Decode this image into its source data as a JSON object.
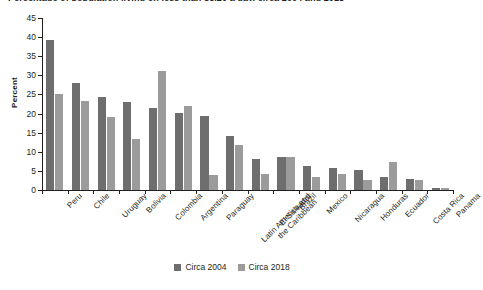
{
  "title_sliver": "Percentage of population living on less than $3.20 a day, circa 2004 and 2018",
  "chart_data": {
    "type": "bar",
    "title": "",
    "xlabel": "",
    "ylabel": "Percent",
    "ylim": [
      0,
      45
    ],
    "yticks": [
      0,
      5,
      10,
      15,
      20,
      25,
      30,
      35,
      40,
      45
    ],
    "grid": false,
    "legend_position": "bottom",
    "categories": [
      "Peru",
      "Chile",
      "Uruguay",
      "Bolivia",
      "Colombia",
      "Argentina",
      "Paraguay",
      "Latin America and\nthe Caribbean",
      "El Salvador",
      "Brazil",
      "Mexico",
      "Nicaragua",
      "Honduras",
      "Ecuador",
      "Costa Rica",
      "Panama"
    ],
    "series": [
      {
        "name": "Circa 2004",
        "color": "#6e6e6e",
        "values": [
          39.3,
          28.1,
          24.3,
          23.0,
          21.4,
          20.2,
          19.3,
          14.2,
          8.2,
          8.6,
          6.2,
          5.7,
          5.3,
          3.5,
          2.8,
          0.5
        ]
      },
      {
        "name": "Circa 2018",
        "color": "#9b9b9b",
        "values": [
          25.0,
          23.4,
          19.1,
          13.3,
          31.2,
          22.0,
          4.0,
          11.8,
          4.2,
          8.7,
          3.4,
          4.1,
          2.6,
          7.2,
          2.6,
          0.6
        ]
      }
    ]
  },
  "legend": {
    "items": [
      {
        "label": "Circa 2004"
      },
      {
        "label": "Circa 2018"
      }
    ]
  }
}
